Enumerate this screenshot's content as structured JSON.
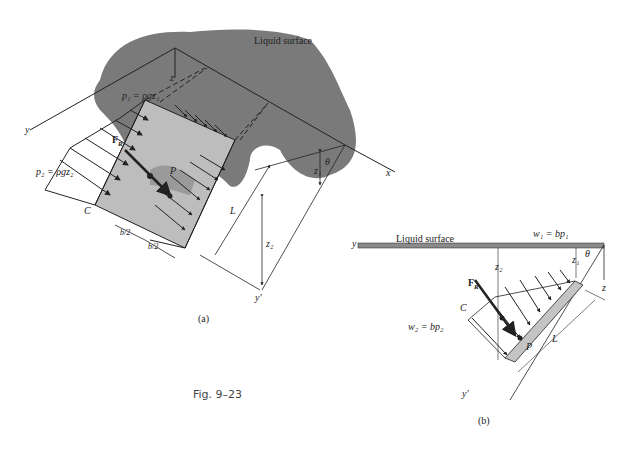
{
  "figure": {
    "caption": "Fig. 9–23",
    "panel_a": {
      "label": "(a)",
      "liquid_surface": "Liquid surface",
      "p1": "p₁ = ρgz₁",
      "p2": "p₂ = ρgz₂",
      "force": "F",
      "force_sub": "R",
      "point_p": "P",
      "point_c": "C",
      "axis_x": "x",
      "axis_y": "y",
      "axis_z": "z",
      "axis_yprime": "y′",
      "theta": "θ",
      "z1": "z₁",
      "z2": "z₂",
      "length": "L",
      "half_b_1": "b/2",
      "half_b_2": "b/2"
    },
    "panel_b": {
      "label": "(b)",
      "liquid_surface": "Liquid surface",
      "w1": "w₁ = bp₁",
      "w2": "w₂ = bp₂",
      "force": "F",
      "force_sub": "R",
      "point_p": "P",
      "point_c": "C",
      "axis_y": "y",
      "axis_z": "z",
      "axis_yprime": "y′",
      "theta": "θ",
      "z1": "z₁",
      "z2": "z₂",
      "length": "L"
    },
    "colors": {
      "liquid": "#7a7a7a",
      "plate": "#c4c4c4",
      "ink": "#222222"
    }
  }
}
